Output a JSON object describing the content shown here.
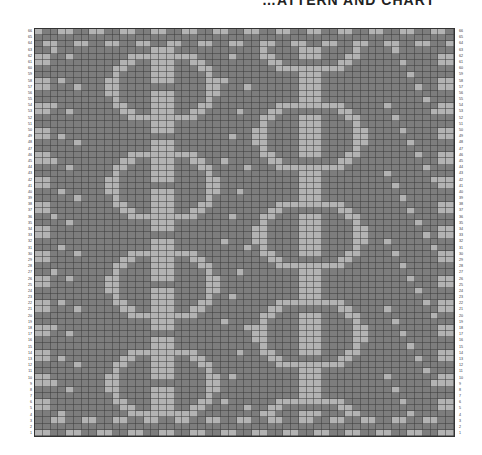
{
  "title": "…ATTERN AND CHART",
  "chart": {
    "rows": 66,
    "cols": 54,
    "colors": {
      "background": "#7d7d7d",
      "contrast": "#b3b3b3",
      "gridline": "#333333"
    },
    "row_labels_left": "1-66 bottom to top",
    "row_labels_right": "1-66 bottom to top",
    "motifs": [
      {
        "name": "left-vertical-motif",
        "center_col": 16
      },
      {
        "name": "right-vertical-motif",
        "center_col": 35
      }
    ]
  },
  "chart_data": {
    "type": "heatmap",
    "title": "…ATTERN AND CHART",
    "xlabel": "",
    "ylabel": "",
    "rows": 66,
    "cols": 54,
    "y_tick_labels": [
      "1",
      "2",
      "3",
      "4",
      "5",
      "6",
      "7",
      "8",
      "9",
      "10",
      "11",
      "12",
      "13",
      "14",
      "15",
      "16",
      "17",
      "18",
      "19",
      "20",
      "21",
      "22",
      "23",
      "24",
      "25",
      "26",
      "27",
      "28",
      "29",
      "30",
      "31",
      "32",
      "33",
      "34",
      "35",
      "36",
      "37",
      "38",
      "39",
      "40",
      "41",
      "42",
      "43",
      "44",
      "45",
      "46",
      "47",
      "48",
      "49",
      "50",
      "51",
      "52",
      "53",
      "54",
      "55",
      "56",
      "57",
      "58",
      "59",
      "60",
      "61",
      "62",
      "63",
      "64",
      "65",
      "66"
    ],
    "legend": [
      {
        "label": "background",
        "color": "#7d7d7d"
      },
      {
        "label": "contrast",
        "color": "#b3b3b3"
      }
    ],
    "grid": true
  }
}
